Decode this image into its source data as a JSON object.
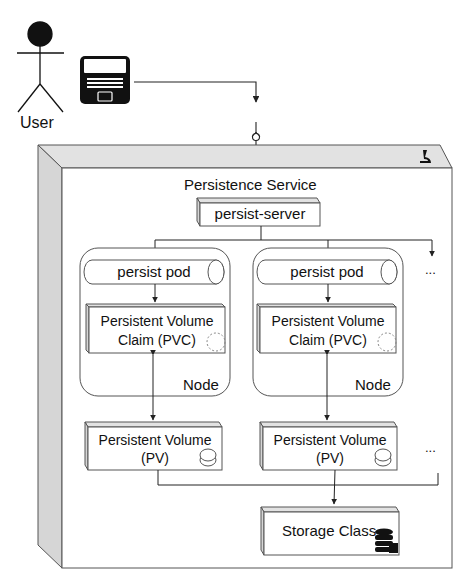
{
  "actor": {
    "label": "User",
    "icon": "stick-figure-icon"
  },
  "device": {
    "icon": "laptop-icon"
  },
  "service": {
    "title": "Persistence Service",
    "corner_icon": "microscope-icon",
    "server": {
      "label": "persist-server"
    },
    "nodes": [
      {
        "label": "Node",
        "pod": "persist pod",
        "pvc": {
          "line1": "Persistent Volume",
          "line2": "Claim (PVC)"
        },
        "pv": {
          "line1": "Persistent Volume",
          "line2": "(PV)"
        }
      },
      {
        "label": "Node",
        "pod": "persist pod",
        "pvc": {
          "line1": "Persistent Volume",
          "line2": "Claim (PVC)"
        },
        "pv": {
          "line1": "Persistent Volume",
          "line2": "(PV)"
        }
      }
    ],
    "more_nodes": "...",
    "more_pvs": "...",
    "storage_class": {
      "label": "Storage Class",
      "icon": "database-icon"
    }
  },
  "colors": {
    "stroke": "#444444",
    "face_shade": "#d9d9d9",
    "top_shade": "#e2e2e2",
    "fill": "#ffffff",
    "ink": "#111111"
  }
}
